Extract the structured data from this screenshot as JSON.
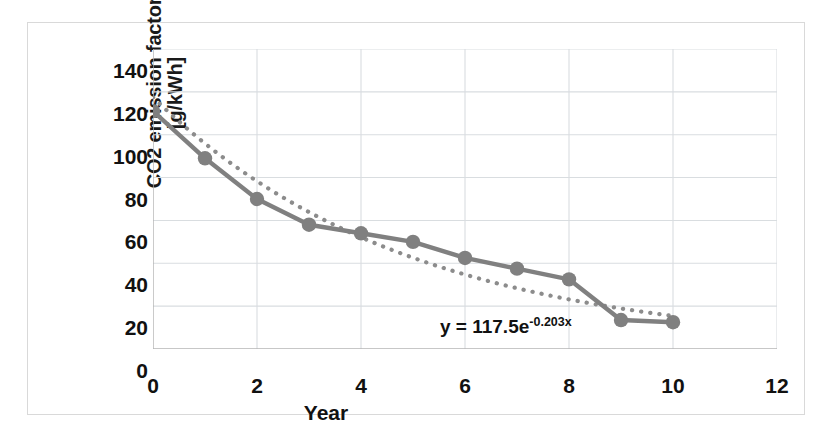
{
  "chart_data": {
    "type": "line",
    "title": "",
    "xlabel": "Year",
    "ylabel": "CO2 emission factor [g/kWh]",
    "ylabel_line1": "CO2 emission factor",
    "ylabel_line2": "[g/kWh]",
    "xlim": [
      0,
      12
    ],
    "ylim": [
      0,
      140
    ],
    "xticks": [
      0,
      2,
      4,
      6,
      8,
      10,
      12
    ],
    "xtick_labels": [
      "0",
      "2",
      "4",
      "6",
      "8",
      "10",
      "12"
    ],
    "yticks": [
      0,
      20,
      40,
      60,
      80,
      100,
      120,
      140
    ],
    "ytick_labels": [
      "0",
      "20",
      "40",
      "60",
      "80",
      "100",
      "120",
      "140"
    ],
    "grid": true,
    "legend": "none",
    "x": [
      0,
      1,
      2,
      3,
      4,
      5,
      6,
      7,
      8,
      9,
      10
    ],
    "series": [
      {
        "name": "CO2 emission factor",
        "style": "solid-line-with-round-markers",
        "color": "#808080",
        "values": [
          111,
          89,
          70,
          58,
          54,
          50,
          42.5,
          37.5,
          32.5,
          13.5,
          12.5
        ]
      },
      {
        "name": "Exponential trendline",
        "style": "dotted",
        "color": "#8c8c8c",
        "equation": "y = 117.5e^(-0.203x)",
        "coefficient": 117.5,
        "exponent": -0.203,
        "values": [
          117.5,
          95.9,
          78.3,
          63.9,
          52.2,
          42.6,
          34.7,
          28.4,
          23.2,
          18.9,
          15.4
        ]
      }
    ],
    "annotations": [
      {
        "name": "trendline-equation",
        "text_prefix": "y = 117.5e",
        "text_exponent": "-0.203x",
        "text_full": "y = 117.5e-0.203x"
      }
    ],
    "colors": {
      "series_line": "#808080",
      "trendline": "#8c8c8c",
      "gridline": "#d9dde0",
      "axis": "#b4b4b4",
      "text": "#111111",
      "frame": "#d9d9d9",
      "background": "#ffffff"
    }
  }
}
